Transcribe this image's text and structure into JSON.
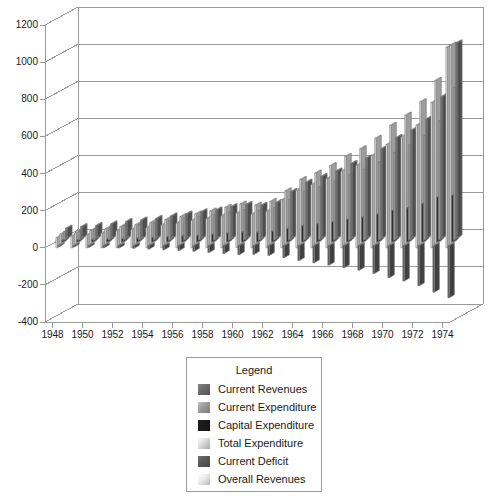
{
  "chart_data": {
    "type": "bar",
    "title": "",
    "subtitle": "",
    "xlabel": "",
    "ylabel": "",
    "ylim": [
      -400,
      1200
    ],
    "ytick_step": 200,
    "yticks": [
      1200,
      1000,
      800,
      600,
      400,
      200,
      0,
      -200,
      -400
    ],
    "grid": true,
    "three_d": true,
    "legend_position": "bottom-center",
    "x": [
      1948,
      1949,
      1950,
      1951,
      1952,
      1953,
      1954,
      1955,
      1956,
      1957,
      1958,
      1959,
      1960,
      1961,
      1962,
      1963,
      1964,
      1965,
      1966,
      1967,
      1968,
      1969,
      1970,
      1971,
      1972,
      1973,
      1974
    ],
    "xtick_labels": [
      "1948",
      "1950",
      "1952",
      "1954",
      "1956",
      "1958",
      "1960",
      "1962",
      "1964",
      "1966",
      "1968",
      "1970",
      "1972",
      "1974"
    ],
    "series": [
      {
        "name": "Current Revenues",
        "color": "#6b6b6b",
        "values": [
          52,
          60,
          66,
          75,
          88,
          96,
          104,
          118,
          128,
          140,
          150,
          168,
          180,
          175,
          190,
          250,
          300,
          330,
          360,
          400,
          430,
          480,
          540,
          580,
          640,
          760,
          1050
        ]
      },
      {
        "name": "Current Expenditure",
        "color": "#9a9a9a",
        "values": [
          44,
          50,
          58,
          66,
          76,
          84,
          92,
          104,
          116,
          126,
          136,
          150,
          162,
          158,
          172,
          215,
          260,
          285,
          315,
          350,
          380,
          420,
          470,
          510,
          560,
          640,
          820
        ]
      },
      {
        "name": "Capital Expenditure",
        "color": "#1a1a1a",
        "values": [
          8,
          10,
          12,
          14,
          16,
          18,
          22,
          26,
          30,
          34,
          40,
          46,
          52,
          50,
          56,
          70,
          86,
          96,
          106,
          120,
          132,
          148,
          168,
          182,
          205,
          240,
          250
        ]
      },
      {
        "name": "Total Expenditure",
        "color": "#d8d8d8",
        "values": [
          52,
          60,
          70,
          80,
          92,
          102,
          114,
          130,
          146,
          160,
          176,
          196,
          214,
          208,
          228,
          285,
          346,
          381,
          421,
          470,
          512,
          568,
          638,
          692,
          765,
          880,
          1070
        ]
      },
      {
        "name": "Current Deficit",
        "color": "#595959",
        "values": [
          -4,
          -6,
          -8,
          -10,
          -12,
          -14,
          -18,
          -22,
          -26,
          -30,
          -36,
          -42,
          -48,
          -46,
          -52,
          -64,
          -80,
          -92,
          -104,
          -118,
          -132,
          -150,
          -172,
          -190,
          -215,
          -250,
          -280
        ]
      },
      {
        "name": "Overall Revenues",
        "color": "#eaeaea",
        "values": [
          54,
          62,
          68,
          78,
          90,
          98,
          108,
          122,
          132,
          146,
          156,
          172,
          186,
          180,
          196,
          258,
          310,
          340,
          372,
          412,
          444,
          496,
          556,
          598,
          660,
          782,
          1080
        ]
      }
    ]
  },
  "legend": {
    "title": "Legend",
    "items": [
      {
        "label": "Current Revenues",
        "color": "#6b6b6b"
      },
      {
        "label": "Current Expenditure",
        "color": "#9a9a9a"
      },
      {
        "label": "Capital Expenditure",
        "color": "#1a1a1a"
      },
      {
        "label": "Total Expenditure",
        "color": "#d8d8d8"
      },
      {
        "label": "Current Deficit",
        "color": "#595959"
      },
      {
        "label": "Overall Revenues",
        "color": "#eaeaea"
      }
    ]
  }
}
